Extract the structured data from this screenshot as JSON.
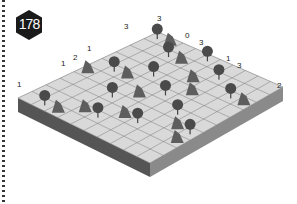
{
  "puzzle": {
    "number": "178",
    "type": "tents-and-trees",
    "grid_size": 10
  },
  "clues": {
    "left_edge": [
      {
        "label": "1",
        "x": 17,
        "y": 81
      },
      {
        "label": "1",
        "x": 61,
        "y": 60
      },
      {
        "label": "2",
        "x": 73,
        "y": 54
      },
      {
        "label": "1",
        "x": 87,
        "y": 45
      },
      {
        "label": "3",
        "x": 124,
        "y": 23
      },
      {
        "label": "3",
        "x": 157,
        "y": 15
      }
    ],
    "right_edge": [
      {
        "label": "0",
        "x": 185,
        "y": 32
      },
      {
        "label": "3",
        "x": 199,
        "y": 39
      },
      {
        "label": "1",
        "x": 226,
        "y": 55
      },
      {
        "label": "3",
        "x": 237,
        "y": 62
      },
      {
        "label": "2",
        "x": 277,
        "y": 82
      }
    ]
  },
  "colors": {
    "badge": "#1a1a1a",
    "tile": "#d9d9d9",
    "grid": "#7a7a7a",
    "side_left": "#555555",
    "side_right": "#8a8a8a",
    "tree": "#4a4a4a",
    "tent": "#5e5e5e"
  }
}
